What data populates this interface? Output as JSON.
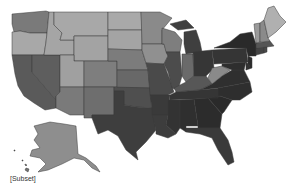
{
  "map": {
    "type": "choropleth",
    "region": "United States",
    "color_scheme": "grayscale",
    "stroke_color": "#3a3a3a",
    "states": [
      {
        "id": "WA",
        "fill": "#7a7a7a"
      },
      {
        "id": "OR",
        "fill": "#a8a8a8"
      },
      {
        "id": "CA",
        "fill": "#5a5a5a"
      },
      {
        "id": "NV",
        "fill": "#5e5e5e"
      },
      {
        "id": "ID",
        "fill": "#a5a5a5"
      },
      {
        "id": "MT",
        "fill": "#a8a8a8"
      },
      {
        "id": "WY",
        "fill": "#a3a3a3"
      },
      {
        "id": "UT",
        "fill": "#a0a0a0"
      },
      {
        "id": "AZ",
        "fill": "#7a7a7a"
      },
      {
        "id": "CO",
        "fill": "#7e7e7e"
      },
      {
        "id": "NM",
        "fill": "#6e6e6e"
      },
      {
        "id": "ND",
        "fill": "#a9a9a9"
      },
      {
        "id": "SD",
        "fill": "#a4a4a4"
      },
      {
        "id": "NE",
        "fill": "#7c7c7c"
      },
      {
        "id": "KS",
        "fill": "#686868"
      },
      {
        "id": "OK",
        "fill": "#4f4f4f"
      },
      {
        "id": "TX",
        "fill": "#3e3e3e"
      },
      {
        "id": "MN",
        "fill": "#8a8a8a"
      },
      {
        "id": "IA",
        "fill": "#909090"
      },
      {
        "id": "MO",
        "fill": "#4a4a4a"
      },
      {
        "id": "AR",
        "fill": "#3a3a3a"
      },
      {
        "id": "LA",
        "fill": "#3d3d3d"
      },
      {
        "id": "WI",
        "fill": "#7e7e7e"
      },
      {
        "id": "IL",
        "fill": "#4c4c4c"
      },
      {
        "id": "MI",
        "fill": "#3f3f3f"
      },
      {
        "id": "IN",
        "fill": "#6a6a6a"
      },
      {
        "id": "OH",
        "fill": "#363636"
      },
      {
        "id": "KY",
        "fill": "#575757"
      },
      {
        "id": "TN",
        "fill": "#353535"
      },
      {
        "id": "MS",
        "fill": "#333333"
      },
      {
        "id": "AL",
        "fill": "#2f2f2f"
      },
      {
        "id": "GA",
        "fill": "#2c2c2c"
      },
      {
        "id": "FL",
        "fill": "#3a3a3a"
      },
      {
        "id": "SC",
        "fill": "#2a2a2a"
      },
      {
        "id": "NC",
        "fill": "#2e2e2e"
      },
      {
        "id": "VA",
        "fill": "#2f2f2f"
      },
      {
        "id": "WV",
        "fill": "#8a8a8a"
      },
      {
        "id": "PA",
        "fill": "#353535"
      },
      {
        "id": "NY",
        "fill": "#2a2a2a"
      },
      {
        "id": "NJ",
        "fill": "#2c2c2c"
      },
      {
        "id": "MD",
        "fill": "#2e2e2e"
      },
      {
        "id": "DE",
        "fill": "#333333"
      },
      {
        "id": "CT",
        "fill": "#444444"
      },
      {
        "id": "RI",
        "fill": "#4a4a4a"
      },
      {
        "id": "MA",
        "fill": "#555555"
      },
      {
        "id": "VT",
        "fill": "#9a9a9a"
      },
      {
        "id": "NH",
        "fill": "#8a8a8a"
      },
      {
        "id": "ME",
        "fill": "#b0b0b0"
      },
      {
        "id": "AK",
        "fill": "#8e8e8e"
      },
      {
        "id": "HI",
        "fill": "#707070"
      }
    ]
  },
  "caption": "[Subset]"
}
